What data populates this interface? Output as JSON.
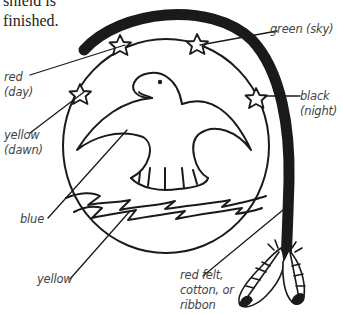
{
  "caption": {
    "lines": "shield is\nfinished."
  },
  "labels": {
    "green_sky": "green (sky)",
    "red_day": "red\n(day)",
    "yellow_dawn": "yellow\n(dawn)",
    "black_night": "black\n(night)",
    "blue": "blue",
    "yellow": "yellow",
    "red_felt": "red felt,\ncotton, or\nribbon"
  },
  "illustration": {
    "subject": "shield with eagle, stars, waves and hanging feathers",
    "ink_color": "#1a1a1a",
    "stars": 5,
    "feathers": 2
  }
}
